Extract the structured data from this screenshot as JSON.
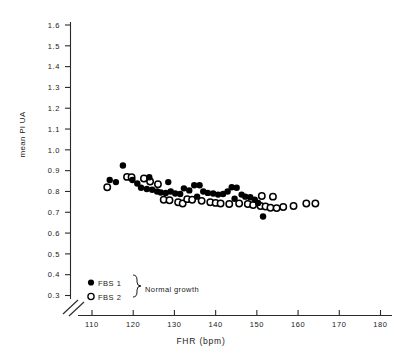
{
  "chart_data": {
    "type": "scatter",
    "title": "",
    "xlabel": "FHR (bpm)",
    "ylabel": "mean PI UA",
    "xlim": [
      105,
      183
    ],
    "ylim": [
      0.28,
      1.63
    ],
    "xticks": [
      110,
      120,
      130,
      140,
      150,
      160,
      170,
      180
    ],
    "yticks": [
      0.3,
      0.4,
      0.5,
      0.6,
      0.7,
      0.8,
      0.9,
      1.0,
      1.1,
      1.2,
      1.3,
      1.4,
      1.5,
      1.6
    ],
    "xtick_labels": [
      "110",
      "120",
      "130",
      "140",
      "150",
      "160",
      "170",
      "180"
    ],
    "ytick_labels": [
      "0.3",
      "0.4",
      "0.5",
      "0.6",
      "0.7",
      "0.8",
      "0.9",
      "1.0",
      "1.1",
      "1.2",
      "1.3",
      "1.4",
      "1.5",
      "1.6"
    ],
    "grid": false,
    "axis_break_x": true,
    "axis_break_y": true,
    "legend_position": "lower-left-inside",
    "legend_brace_label": "Normal growth",
    "series": [
      {
        "name": "FBS 1",
        "marker": "filled-circle",
        "color": "#000000",
        "points": [
          [
            117.5,
            0.925
          ],
          [
            114.3,
            0.855
          ],
          [
            115.8,
            0.845
          ],
          [
            119.8,
            0.855
          ],
          [
            121.0,
            0.838
          ],
          [
            121.9,
            0.818
          ],
          [
            123.3,
            0.812
          ],
          [
            124.6,
            0.808
          ],
          [
            125.8,
            0.8
          ],
          [
            126.7,
            0.795
          ],
          [
            127.9,
            0.793
          ],
          [
            129.1,
            0.8
          ],
          [
            130.2,
            0.79
          ],
          [
            131.4,
            0.788
          ],
          [
            132.3,
            0.815
          ],
          [
            133.6,
            0.805
          ],
          [
            134.8,
            0.83
          ],
          [
            136.1,
            0.83
          ],
          [
            137.0,
            0.8
          ],
          [
            138.1,
            0.793
          ],
          [
            139.4,
            0.79
          ],
          [
            140.6,
            0.785
          ],
          [
            141.8,
            0.788
          ],
          [
            142.9,
            0.8
          ],
          [
            143.9,
            0.82
          ],
          [
            145.1,
            0.818
          ],
          [
            146.3,
            0.785
          ],
          [
            147.2,
            0.775
          ],
          [
            148.4,
            0.772
          ],
          [
            149.5,
            0.76
          ],
          [
            150.3,
            0.745
          ],
          [
            151.5,
            0.68
          ],
          [
            123.9,
            0.868
          ],
          [
            128.5,
            0.845
          ],
          [
            135.5,
            0.775
          ],
          [
            144.6,
            0.765
          ]
        ]
      },
      {
        "name": "FBS 2",
        "marker": "open-circle",
        "color": "#000000",
        "points": [
          [
            113.7,
            0.82
          ],
          [
            118.5,
            0.87
          ],
          [
            119.6,
            0.868
          ],
          [
            122.6,
            0.862
          ],
          [
            124.1,
            0.848
          ],
          [
            126.0,
            0.835
          ],
          [
            127.4,
            0.76
          ],
          [
            128.8,
            0.758
          ],
          [
            130.9,
            0.748
          ],
          [
            132.0,
            0.742
          ],
          [
            133.1,
            0.763
          ],
          [
            134.3,
            0.76
          ],
          [
            136.6,
            0.755
          ],
          [
            138.7,
            0.748
          ],
          [
            140.0,
            0.745
          ],
          [
            141.2,
            0.742
          ],
          [
            143.3,
            0.74
          ],
          [
            145.7,
            0.742
          ],
          [
            147.8,
            0.74
          ],
          [
            149.1,
            0.735
          ],
          [
            150.9,
            0.73
          ],
          [
            152.1,
            0.728
          ],
          [
            153.3,
            0.722
          ],
          [
            154.8,
            0.72
          ],
          [
            156.4,
            0.725
          ],
          [
            158.9,
            0.73
          ],
          [
            162.0,
            0.742
          ],
          [
            164.2,
            0.742
          ],
          [
            153.9,
            0.775
          ],
          [
            151.2,
            0.778
          ]
        ]
      }
    ]
  },
  "legend": {
    "items": [
      {
        "label": "FBS 1",
        "marker": "filled-circle"
      },
      {
        "label": "FBS 2",
        "marker": "open-circle"
      }
    ],
    "brace_label": "Normal growth"
  },
  "axes": {
    "x_title": "FHR (bpm)",
    "y_title": "mean PI UA"
  }
}
